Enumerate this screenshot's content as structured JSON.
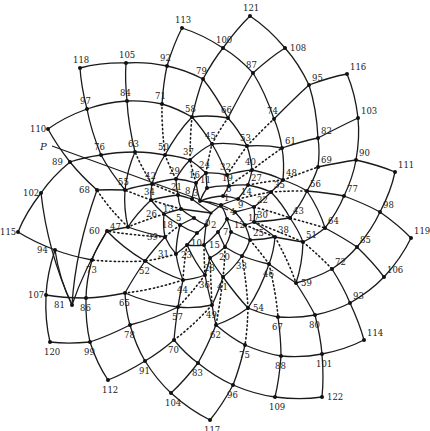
{
  "diagram": {
    "title": "",
    "type": "phyllotaxis-spiral-lattice",
    "center": [
      211,
      213
    ],
    "pointer_label": "P",
    "pointer_line": [
      [
        52,
        146
      ],
      [
        228,
        210
      ]
    ],
    "node_count": 123,
    "node_first": 0,
    "node_last": 122,
    "parastichy_steps": {
      "solid": [
        8,
        13,
        21
      ],
      "dotted": [
        21,
        34
      ]
    },
    "nodes": {
      "0": [
        211,
        213
      ],
      "1": [
        221,
        205
      ],
      "2": [
        206,
        225
      ],
      "3": [
        200,
        201
      ],
      "4": [
        227,
        219
      ],
      "5": [
        194,
        218
      ],
      "6": [
        223,
        196
      ],
      "7": [
        218,
        232
      ],
      "8": [
        192,
        199
      ],
      "9": [
        235,
        212
      ],
      "10": [
        197,
        233
      ],
      "11": [
        207,
        188
      ],
      "12": [
        231,
        232
      ],
      "13": [
        181,
        209
      ],
      "14": [
        238,
        199
      ],
      "15": [
        204,
        245
      ],
      "16": [
        196,
        183
      ],
      "17": [
        245,
        225
      ],
      "18": [
        180,
        225
      ],
      "19": [
        229,
        186
      ],
      "20": [
        225,
        247
      ],
      "21": [
        178,
        195
      ],
      "22": [
        254,
        207
      ],
      "23": [
        187,
        245
      ],
      "24": [
        206,
        173
      ],
      "25": [
        250,
        240
      ],
      "26": [
        164,
        214
      ],
      "27": [
        248,
        185
      ],
      "28": [
        210,
        258
      ],
      "29": [
        176,
        179
      ],
      "30": [
        254,
        222
      ],
      "31": [
        176,
        254
      ],
      "32": [
        227,
        175
      ],
      "33": [
        242,
        256
      ],
      "34": [
        151,
        200
      ],
      "35": [
        271,
        192
      ],
      "36": [
        205,
        275
      ],
      "37": [
        190,
        160
      ],
      "38": [
        275,
        237
      ],
      "39": [
        165,
        237
      ],
      "40": [
        252,
        170
      ],
      "41": [
        223,
        277
      ],
      "42": [
        152,
        184
      ],
      "43": [
        290,
        218
      ],
      "44": [
        183,
        280
      ],
      "45": [
        212,
        144
      ],
      "46": [
        269,
        264
      ],
      "47": [
        128,
        227
      ],
      "48": [
        283,
        180
      ],
      "49": [
        212,
        305
      ],
      "50": [
        165,
        155
      ],
      "51": [
        303,
        242
      ],
      "52": [
        145,
        261
      ],
      "53": [
        247,
        146
      ],
      "54": [
        248,
        308
      ],
      "55": [
        125,
        190
      ],
      "56": [
        307,
        191
      ],
      "57": [
        178,
        307
      ],
      "58": [
        192,
        117
      ],
      "59": [
        296,
        283
      ],
      "60": [
        107,
        231
      ],
      "61": [
        282,
        148
      ],
      "62": [
        216,
        325
      ],
      "63": [
        135,
        152
      ],
      "64": [
        325,
        228
      ],
      "65": [
        125,
        293
      ],
      "66": [
        228,
        118
      ],
      "67": [
        278,
        317
      ],
      "68": [
        97,
        190
      ],
      "69": [
        318,
        167
      ],
      "70": [
        174,
        340
      ],
      "71": [
        162,
        104
      ],
      "72": [
        332,
        269
      ],
      "73": [
        92,
        260
      ],
      "74": [
        274,
        119
      ],
      "75": [
        245,
        345
      ],
      "76": [
        101,
        155
      ],
      "77": [
        344,
        196
      ],
      "78": [
        130,
        325
      ],
      "79": [
        203,
        79
      ],
      "80": [
        315,
        315
      ],
      "81": [
        72,
        305
      ],
      "82": [
        318,
        138
      ],
      "83": [
        198,
        363
      ],
      "84": [
        127,
        101
      ],
      "85": [
        357,
        247
      ],
      "86": [
        86,
        298
      ],
      "87": [
        253,
        73
      ],
      "88": [
        281,
        356
      ],
      "89": [
        70,
        162
      ],
      "90": [
        356,
        160
      ],
      "91": [
        145,
        361
      ],
      "92": [
        167,
        66
      ],
      "93": [
        350,
        303
      ],
      "94": [
        55,
        250
      ],
      "95": [
        309,
        85
      ],
      "96": [
        233,
        385
      ],
      "97": [
        87,
        109
      ],
      "98": [
        380,
        212
      ],
      "99": [
        90,
        342
      ],
      "100": [
        223,
        48
      ],
      "101": [
        322,
        354
      ],
      "102": [
        41,
        193
      ],
      "103": [
        358,
        118
      ],
      "104": [
        171,
        393
      ],
      "105": [
        126,
        63
      ],
      "106": [
        384,
        277
      ],
      "107": [
        46,
        295
      ],
      "108": [
        285,
        48
      ],
      "109": [
        275,
        397
      ],
      "110": [
        48,
        129
      ],
      "111": [
        395,
        172
      ],
      "112": [
        108,
        380
      ],
      "113": [
        182,
        28
      ],
      "114": [
        364,
        340
      ],
      "115": [
        18,
        232
      ],
      "116": [
        347,
        74
      ],
      "117": [
        210,
        420
      ],
      "118": [
        80,
        68
      ],
      "119": [
        411,
        238
      ],
      "120": [
        50,
        342
      ],
      "121": [
        250,
        16
      ],
      "122": [
        322,
        397
      ]
    },
    "label_offsets": {
      "default": [
        3,
        -4
      ],
      "right": [
        5,
        3
      ],
      "left": [
        -18,
        3
      ],
      "below": [
        -6,
        13
      ],
      "above": [
        -7,
        -5
      ]
    },
    "label_placement": {
      "0": "below",
      "2": "right",
      "3": "above",
      "5": "left",
      "7": "right",
      "8": "above",
      "10": "below",
      "11": "above",
      "13": "left",
      "15": "right",
      "16": "above",
      "18": "left",
      "19": "above",
      "20": "below",
      "21": "above",
      "23": "below",
      "24": "above",
      "26": "left",
      "28": "below",
      "29": "above",
      "31": "left",
      "32": "above",
      "33": "below",
      "34": "above",
      "36": "below",
      "37": "above",
      "39": "left",
      "40": "above",
      "41": "below",
      "42": "above",
      "44": "below",
      "45": "above",
      "46": "below",
      "47": "left",
      "49": "below",
      "50": "above",
      "52": "below",
      "53": "above",
      "54": "right",
      "55": "above",
      "57": "below",
      "58": "above",
      "59": "right",
      "60": "left",
      "62": "below",
      "63": "above",
      "65": "below",
      "66": "above",
      "67": "below",
      "68": "left",
      "70": "below",
      "71": "above",
      "73": "below",
      "74": "above",
      "75": "below",
      "76": "above",
      "78": "below",
      "79": "above",
      "80": "below",
      "81": "left",
      "83": "below",
      "84": "above",
      "86": "below",
      "87": "above",
      "88": "below",
      "89": "left",
      "91": "below",
      "92": "above",
      "94": "left",
      "96": "below",
      "97": "above",
      "99": "below",
      "100": "above",
      "101": "below",
      "102": "left",
      "104": "below",
      "105": "above",
      "107": "left",
      "108": "right",
      "109": "below",
      "110": "left",
      "112": "below",
      "113": "above",
      "115": "left",
      "117": "below",
      "118": "above",
      "120": "below",
      "121": "above",
      "122": "right"
    }
  }
}
